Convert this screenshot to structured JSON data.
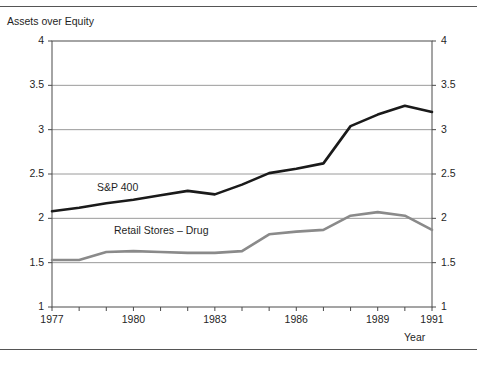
{
  "header": {
    "clipped_text": ""
  },
  "axes": {
    "y_label": "Assets over Equity",
    "x_label": "Year",
    "y_ticks": [
      "1",
      "1.5",
      "2",
      "2.5",
      "3",
      "3.5",
      "4"
    ],
    "x_ticks_labeled": [
      "1977",
      "1980",
      "1983",
      "1986",
      "1989",
      "1991"
    ]
  },
  "series_labels": {
    "sp400": "S&P 400",
    "retail": "Retail Stores – Drug"
  },
  "colors": {
    "sp400": "#1a1a1a",
    "retail": "#8a8a8a",
    "grid": "#9a9a9a",
    "frame": "#4a4a4a"
  },
  "chart_data": {
    "type": "line",
    "title": "",
    "xlabel": "Year",
    "ylabel": "Assets over Equity",
    "xlim": [
      1977,
      1991
    ],
    "ylim": [
      1,
      4
    ],
    "grid": true,
    "legend": "inline-labels",
    "x": [
      1977,
      1978,
      1979,
      1980,
      1981,
      1982,
      1983,
      1984,
      1985,
      1986,
      1987,
      1988,
      1989,
      1990,
      1991
    ],
    "y_ticks": [
      1,
      1.5,
      2,
      2.5,
      3,
      3.5,
      4
    ],
    "x_ticks_labeled": [
      1977,
      1980,
      1983,
      1986,
      1989,
      1991
    ],
    "series": [
      {
        "name": "S&P 400",
        "color": "#1a1a1a",
        "values": [
          2.08,
          2.12,
          2.17,
          2.21,
          2.26,
          2.31,
          2.27,
          2.38,
          2.51,
          2.56,
          2.62,
          3.04,
          3.17,
          3.27,
          3.2
        ]
      },
      {
        "name": "Retail Stores – Drug",
        "color": "#8a8a8a",
        "values": [
          1.53,
          1.53,
          1.62,
          1.63,
          1.62,
          1.61,
          1.61,
          1.63,
          1.82,
          1.85,
          1.87,
          2.03,
          2.07,
          2.03,
          1.87
        ]
      }
    ]
  }
}
